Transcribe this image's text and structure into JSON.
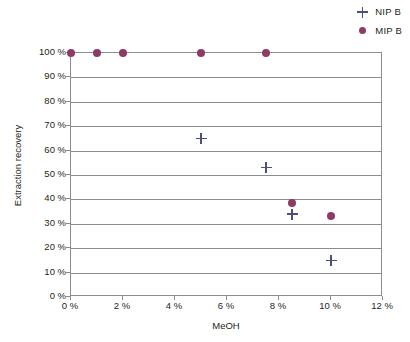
{
  "chart_data": {
    "type": "scatter",
    "title": "",
    "xlabel": "MeOH",
    "ylabel": "Extraction recovery",
    "xlim": [
      0,
      12
    ],
    "ylim": [
      0,
      100
    ],
    "xticks": [
      0,
      2,
      4,
      6,
      8,
      10,
      12
    ],
    "xtick_labels": [
      "0 %",
      "2 %",
      "4 %",
      "6 %",
      "8 %",
      "10 %",
      "12 %"
    ],
    "yticks": [
      0,
      10,
      20,
      30,
      40,
      50,
      60,
      70,
      80,
      90,
      100
    ],
    "ytick_labels": [
      "0 %",
      "10 %",
      "20 %",
      "30 %",
      "40 %",
      "50 %",
      "60 %",
      "70 %",
      "80 %",
      "90 %",
      "100 %"
    ],
    "grid": "horizontal",
    "legend_position": "top-right",
    "series": [
      {
        "name": "NIP B",
        "marker": "plus",
        "color": "#4a4f7d",
        "points": [
          {
            "x": 5.0,
            "y": 65
          },
          {
            "x": 7.5,
            "y": 53
          },
          {
            "x": 8.5,
            "y": 34
          },
          {
            "x": 10.0,
            "y": 15
          }
        ]
      },
      {
        "name": "MIP B",
        "marker": "circle",
        "color": "#8d3a66",
        "points": [
          {
            "x": 0.0,
            "y": 100
          },
          {
            "x": 1.0,
            "y": 100
          },
          {
            "x": 2.0,
            "y": 100
          },
          {
            "x": 5.0,
            "y": 100
          },
          {
            "x": 7.5,
            "y": 100
          },
          {
            "x": 8.5,
            "y": 38.5
          },
          {
            "x": 10.0,
            "y": 33
          }
        ]
      }
    ]
  },
  "legend": {
    "entries": [
      {
        "label": "NIP B",
        "marker": "plus"
      },
      {
        "label": "MIP B",
        "marker": "circle"
      }
    ]
  }
}
